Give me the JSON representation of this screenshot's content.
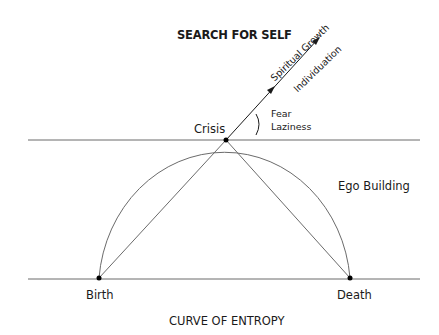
{
  "title": "SEARCH FOR SELF",
  "caption": "CURVE OF ENTROPY",
  "labels": {
    "crisis": "Crisis",
    "birth": "Birth",
    "death": "Death",
    "ego_building": "Ego Building",
    "fear": "Fear",
    "laziness": "Laziness",
    "spiritual_growth": "Spiritual Growth",
    "individuation": "Individuation"
  },
  "colors": {
    "line": "#6b6b6b",
    "arrow": "#1a1a1a",
    "dot": "#000000",
    "text": "#1a1a1a"
  }
}
